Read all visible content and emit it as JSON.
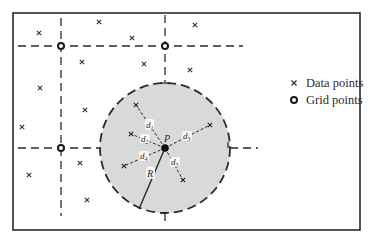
{
  "diagram": {
    "title": "",
    "legend": {
      "data_points_label": "Data points",
      "grid_points_label": "Grid points"
    },
    "labels": {
      "center": "P",
      "radius": "R",
      "d1": "d1",
      "d2": "d2",
      "d3": "d3",
      "d4": "d4",
      "d5": "d5"
    },
    "colors": {
      "ink": "#2a2a2a",
      "circle_fill": "#d9d9d9",
      "background": "#ffffff"
    },
    "frame": {
      "x": 13,
      "y": 13,
      "width": 347,
      "height": 217
    },
    "grid_points": [
      {
        "x": 61,
        "y": 46
      },
      {
        "x": 165,
        "y": 46
      },
      {
        "x": 61,
        "y": 148
      },
      {
        "x": 165,
        "y": 148
      }
    ],
    "search_circle": {
      "cx": 165,
      "cy": 148,
      "r": 65
    },
    "data_points_outside": [
      {
        "x": 39,
        "y": 33
      },
      {
        "x": 99,
        "y": 22
      },
      {
        "x": 132,
        "y": 38
      },
      {
        "x": 82,
        "y": 62
      },
      {
        "x": 144,
        "y": 64
      },
      {
        "x": 195,
        "y": 25
      },
      {
        "x": 190,
        "y": 70
      },
      {
        "x": 40,
        "y": 88
      },
      {
        "x": 85,
        "y": 110
      },
      {
        "x": 22,
        "y": 127
      },
      {
        "x": 80,
        "y": 163
      },
      {
        "x": 29,
        "y": 175
      },
      {
        "x": 87,
        "y": 200
      }
    ],
    "data_points_inside": [
      {
        "id": "d1",
        "x": 136,
        "y": 105
      },
      {
        "id": "d2",
        "x": 131,
        "y": 134
      },
      {
        "id": "d3",
        "x": 210,
        "y": 125
      },
      {
        "id": "d4",
        "x": 124,
        "y": 166
      },
      {
        "id": "d5",
        "x": 183,
        "y": 180
      }
    ]
  }
}
